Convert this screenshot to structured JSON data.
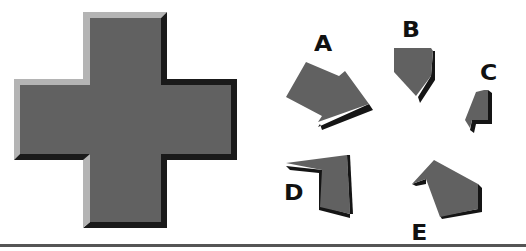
{
  "figure": {
    "type": "shape-puzzle",
    "target_shape": {
      "name": "cross",
      "face_color": "#616161",
      "highlight_color": "#b4b4b4",
      "shadow_color": "#1a1a1a"
    },
    "options": [
      {
        "label": "A"
      },
      {
        "label": "B"
      },
      {
        "label": "C"
      },
      {
        "label": "D"
      },
      {
        "label": "E"
      }
    ],
    "piece_color": "#616161",
    "piece_shadow_color": "#151515",
    "rule_color": "#555555"
  }
}
